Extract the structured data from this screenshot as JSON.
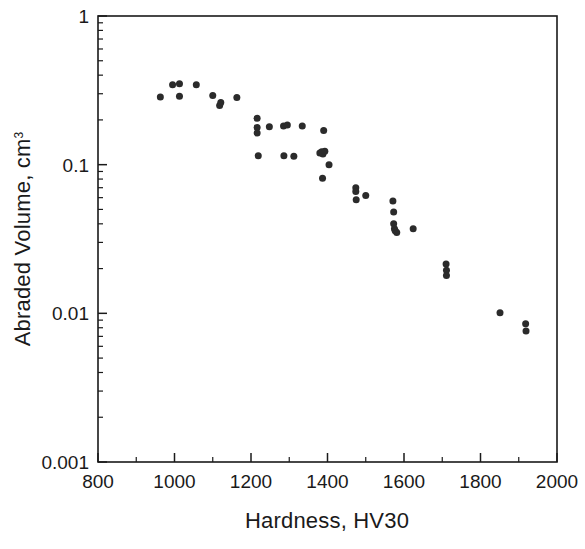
{
  "chart_data": {
    "type": "scatter",
    "title": "",
    "xlabel": "Hardness, HV30",
    "ylabel": "Abraded Volume, cm",
    "ylabel_superscript": "3",
    "xlim": [
      800,
      2000
    ],
    "ylim": [
      0.001,
      1
    ],
    "yscale": "log",
    "xscale": "linear",
    "grid": false,
    "legend": null,
    "xticks": [
      800,
      1000,
      1200,
      1400,
      1600,
      1800,
      2000
    ],
    "xtick_labels": [
      "800",
      "1000",
      "1200",
      "1400",
      "1600",
      "1800",
      "2000"
    ],
    "xminor_step": 100,
    "yticks": [
      0.001,
      0.01,
      0.1,
      1
    ],
    "ytick_labels": [
      "0.001",
      "0.01",
      "0.1",
      "1"
    ],
    "marker": "filled-circle",
    "marker_color": "#2b2b2b",
    "marker_size_px": 7,
    "points": [
      {
        "x": 963,
        "y": 0.285
      },
      {
        "x": 995,
        "y": 0.345
      },
      {
        "x": 1013,
        "y": 0.35
      },
      {
        "x": 1013,
        "y": 0.288
      },
      {
        "x": 1057,
        "y": 0.345
      },
      {
        "x": 1100,
        "y": 0.292
      },
      {
        "x": 1118,
        "y": 0.25
      },
      {
        "x": 1121,
        "y": 0.262
      },
      {
        "x": 1163,
        "y": 0.283
      },
      {
        "x": 1216,
        "y": 0.205
      },
      {
        "x": 1216,
        "y": 0.178
      },
      {
        "x": 1216,
        "y": 0.163
      },
      {
        "x": 1219,
        "y": 0.115
      },
      {
        "x": 1248,
        "y": 0.18
      },
      {
        "x": 1285,
        "y": 0.182
      },
      {
        "x": 1286,
        "y": 0.115
      },
      {
        "x": 1295,
        "y": 0.185
      },
      {
        "x": 1312,
        "y": 0.114
      },
      {
        "x": 1334,
        "y": 0.182
      },
      {
        "x": 1380,
        "y": 0.12
      },
      {
        "x": 1385,
        "y": 0.122
      },
      {
        "x": 1388,
        "y": 0.118
      },
      {
        "x": 1390,
        "y": 0.17
      },
      {
        "x": 1393,
        "y": 0.123
      },
      {
        "x": 1387,
        "y": 0.081
      },
      {
        "x": 1404,
        "y": 0.1
      },
      {
        "x": 1474,
        "y": 0.07
      },
      {
        "x": 1474,
        "y": 0.066
      },
      {
        "x": 1475,
        "y": 0.058
      },
      {
        "x": 1500,
        "y": 0.062
      },
      {
        "x": 1571,
        "y": 0.057
      },
      {
        "x": 1573,
        "y": 0.048
      },
      {
        "x": 1573,
        "y": 0.04
      },
      {
        "x": 1575,
        "y": 0.037
      },
      {
        "x": 1577,
        "y": 0.036
      },
      {
        "x": 1581,
        "y": 0.035
      },
      {
        "x": 1624,
        "y": 0.037
      },
      {
        "x": 1710,
        "y": 0.0215
      },
      {
        "x": 1711,
        "y": 0.0195
      },
      {
        "x": 1711,
        "y": 0.018
      },
      {
        "x": 1851,
        "y": 0.0101
      },
      {
        "x": 1918,
        "y": 0.0085
      },
      {
        "x": 1919,
        "y": 0.0076
      }
    ]
  }
}
